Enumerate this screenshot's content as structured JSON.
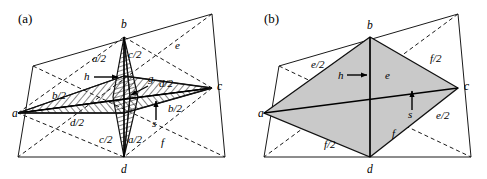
{
  "figure": {
    "panels": [
      {
        "id": "panel-a",
        "tag": "(a)",
        "vertex_labels": [
          {
            "name": "a",
            "text": "a",
            "x": 12,
            "y": 117
          },
          {
            "name": "b",
            "text": "b",
            "x": 121,
            "y": 28
          },
          {
            "name": "c",
            "text": "c",
            "x": 217,
            "y": 90
          },
          {
            "name": "d",
            "text": "d",
            "x": 121,
            "y": 173
          }
        ],
        "edge_labels": [
          {
            "name": "a-over-2-upper",
            "text": "a/2",
            "x": 92,
            "y": 62
          },
          {
            "name": "c-over-2-upper",
            "text": "c/2",
            "x": 128,
            "y": 58
          },
          {
            "name": "c-over-2-lower",
            "text": "c/2",
            "x": 99,
            "y": 143
          },
          {
            "name": "a-over-2-lower",
            "text": "a/2",
            "x": 128,
            "y": 143
          },
          {
            "name": "b-over-2-left",
            "text": "b/2",
            "x": 52,
            "y": 99
          },
          {
            "name": "b-over-2-right",
            "text": "b/2",
            "x": 168,
            "y": 112
          },
          {
            "name": "d-over-2-left",
            "text": "d/2",
            "x": 70,
            "y": 126
          },
          {
            "name": "d-over-2-right",
            "text": "d/2",
            "x": 159,
            "y": 87
          },
          {
            "name": "diagonal-e",
            "text": "e",
            "x": 175,
            "y": 49
          },
          {
            "name": "diagonal-f",
            "text": "f",
            "x": 161,
            "y": 146
          },
          {
            "name": "height-h",
            "text": "h",
            "x": 84,
            "y": 80
          },
          {
            "name": "gap-g",
            "text": "g",
            "x": 148,
            "y": 82
          },
          {
            "name": "height-s",
            "text": "s",
            "x": 152,
            "y": 127
          }
        ]
      },
      {
        "id": "panel-b",
        "tag": "(b)",
        "vertex_labels": [
          {
            "name": "a",
            "text": "a",
            "x": 264,
            "y": 117
          },
          {
            "name": "b",
            "text": "b",
            "x": 369,
            "y": 29
          },
          {
            "name": "c",
            "text": "c",
            "x": 467,
            "y": 90
          },
          {
            "name": "d",
            "text": "d",
            "x": 369,
            "y": 173
          }
        ],
        "edge_labels": [
          {
            "name": "e-over-2-upper-left",
            "text": "e/2",
            "x": 311,
            "y": 68
          },
          {
            "name": "f-over-2-upper-right",
            "text": "f/2",
            "x": 430,
            "y": 62
          },
          {
            "name": "f-over-2-lower-left",
            "text": "f/2",
            "x": 324,
            "y": 148
          },
          {
            "name": "e-over-2-lower-right",
            "text": "e/2",
            "x": 436,
            "y": 119
          },
          {
            "name": "diagonal-e",
            "text": "e",
            "x": 385,
            "y": 79
          },
          {
            "name": "diagonal-f",
            "text": "f",
            "x": 392,
            "y": 137
          },
          {
            "name": "height-h",
            "text": "h",
            "x": 338,
            "y": 79
          },
          {
            "name": "height-s",
            "text": "s",
            "x": 408,
            "y": 118
          }
        ]
      }
    ],
    "colors": {
      "line": "#1a1a1a",
      "shade": "#c9c9c9",
      "background": "#ffffff",
      "text": "#000000"
    }
  }
}
